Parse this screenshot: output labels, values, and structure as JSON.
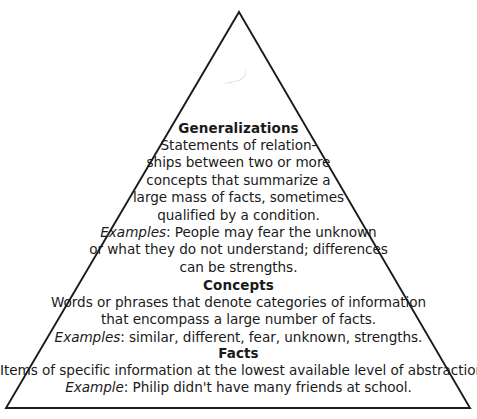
{
  "diagram": {
    "shape": "triangle",
    "stroke_color": "#1c1c1c",
    "background_color": "#ffffff",
    "apex": {
      "x": 239,
      "y": 12
    },
    "base_left": {
      "x": 6,
      "y": 408
    },
    "base_right": {
      "x": 470,
      "y": 408
    }
  },
  "tiers": [
    {
      "id": "generalizations",
      "heading": "Generalizations",
      "lines": [
        "Statements of relation-",
        "ships between two or more",
        "concepts that summarize a",
        "large mass of facts, sometimes",
        "qualified by a condition."
      ],
      "example_label": "Examples",
      "example_lines": [
        ": People may fear the unknown",
        "or what they do not understand; differences",
        "can be strengths."
      ]
    },
    {
      "id": "concepts",
      "heading": "Concepts",
      "lines": [
        "Words or phrases that denote categories of information",
        "that encompass a large number of facts."
      ],
      "example_label": "Examples",
      "example_lines": [
        ": similar, different, fear, unknown, strengths."
      ]
    },
    {
      "id": "facts",
      "heading": "Facts",
      "lines": [
        "Items of specific information at the lowest available level of abstraction."
      ],
      "example_label": "Example",
      "example_lines": [
        ": Philip didn't have many friends at school."
      ]
    }
  ]
}
